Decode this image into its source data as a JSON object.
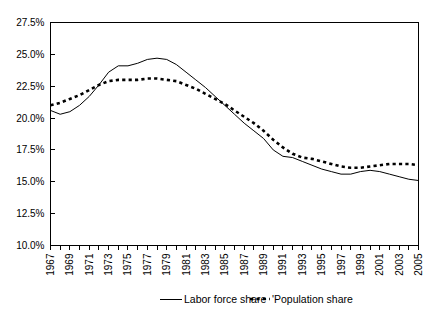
{
  "chart_data": {
    "type": "line",
    "title": "",
    "xlabel": "",
    "ylabel": "",
    "ylim": [
      10.0,
      27.5
    ],
    "ytick_step": 2.5,
    "ytick_labels": [
      "27.5%",
      "25.0%",
      "22.5%",
      "20.0%",
      "17.5%",
      "15.0%",
      "12.5%",
      "10.0%"
    ],
    "ytick_values": [
      27.5,
      25.0,
      22.5,
      20.0,
      17.5,
      15.0,
      12.5,
      10.0
    ],
    "grid": false,
    "legend_position": "bottom",
    "x": [
      1967,
      1968,
      1969,
      1970,
      1971,
      1972,
      1973,
      1974,
      1975,
      1976,
      1977,
      1978,
      1979,
      1980,
      1981,
      1982,
      1983,
      1984,
      1985,
      1986,
      1987,
      1988,
      1989,
      1990,
      1991,
      1992,
      1993,
      1994,
      1995,
      1996,
      1997,
      1998,
      1999,
      2000,
      2001,
      2002,
      2003,
      2004,
      2005
    ],
    "xtick_labels": [
      "1967",
      "1969",
      "1971",
      "1973",
      "1975",
      "1977",
      "1979",
      "1981",
      "1983",
      "1985",
      "1987",
      "1989",
      "1991",
      "1993",
      "1995",
      "1997",
      "1999",
      "2001",
      "2003",
      "2005"
    ],
    "xtick_values": [
      1967,
      1969,
      1971,
      1973,
      1975,
      1977,
      1979,
      1981,
      1983,
      1985,
      1987,
      1989,
      1991,
      1993,
      1995,
      1997,
      1999,
      2001,
      2003,
      2005
    ],
    "xlim": [
      1967,
      2005
    ],
    "series": [
      {
        "name": "Labor force share",
        "style": "solid",
        "color": "#000000",
        "values": [
          20.6,
          20.3,
          20.5,
          21.0,
          21.7,
          22.6,
          23.6,
          24.1,
          24.1,
          24.3,
          24.6,
          24.7,
          24.6,
          24.2,
          23.6,
          23.0,
          22.4,
          21.7,
          21.0,
          20.3,
          19.6,
          19.0,
          18.4,
          17.5,
          17.0,
          16.9,
          16.6,
          16.3,
          16.0,
          15.8,
          15.6,
          15.6,
          15.8,
          15.9,
          15.8,
          15.6,
          15.4,
          15.2,
          15.1
        ]
      },
      {
        "name": "'Population share",
        "style": "dashed",
        "color": "#000000",
        "values": [
          21.0,
          21.2,
          21.5,
          21.8,
          22.2,
          22.6,
          22.9,
          23.0,
          23.0,
          23.0,
          23.1,
          23.1,
          23.0,
          22.9,
          22.6,
          22.3,
          21.9,
          21.5,
          21.1,
          20.6,
          20.1,
          19.6,
          19.0,
          18.3,
          17.7,
          17.2,
          16.9,
          16.8,
          16.6,
          16.4,
          16.2,
          16.1,
          16.1,
          16.2,
          16.3,
          16.4,
          16.4,
          16.4,
          16.3
        ]
      }
    ]
  },
  "legend": {
    "items": [
      {
        "label": "Labor force share",
        "marker": "solid-line-swatch"
      },
      {
        "label": "'Population share",
        "marker": "dashed-line-swatch"
      }
    ]
  }
}
